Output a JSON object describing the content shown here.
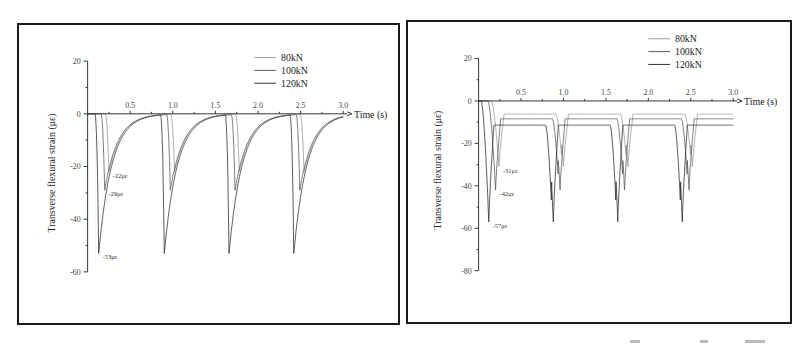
{
  "chart_data": [
    {
      "type": "line",
      "title": "",
      "xlabel": "Time (s)",
      "ylabel": "Transverse flexural strain (με)",
      "xlim": [
        0,
        3.0
      ],
      "ylim": [
        -60,
        20
      ],
      "xticks": [
        "0.5",
        "1.0",
        "1.5",
        "2.0",
        "2.5",
        "3.0"
      ],
      "xtick_values": [
        0.5,
        1.0,
        1.5,
        2.0,
        2.5,
        3.0
      ],
      "yticks": [
        "20",
        "0",
        "-20",
        "-40",
        "-60"
      ],
      "ytick_values": [
        20,
        0,
        -20,
        -40,
        -60
      ],
      "legend": {
        "position": "top-right",
        "entries": [
          "80kN",
          "100kN",
          "120kN"
        ]
      },
      "period_s": 0.77,
      "pulse_shape": "sharp",
      "series": [
        {
          "name": "80kN",
          "color": "#9a9a9a",
          "peak": -22,
          "peak_times": [
            0.25,
            1.02,
            1.78,
            2.54
          ]
        },
        {
          "name": "100kN",
          "color": "#5a5a5a",
          "peak": -29,
          "peak_times": [
            0.2,
            0.97,
            1.73,
            2.49
          ]
        },
        {
          "name": "120kN",
          "color": "#2e2e2e",
          "peak": -53,
          "peak_times": [
            0.13,
            0.9,
            1.66,
            2.42
          ]
        }
      ],
      "annotations": [
        {
          "text": "-22με",
          "x": 0.25,
          "y": -22
        },
        {
          "text": "-29με",
          "x": 0.2,
          "y": -29
        },
        {
          "text": "-53με",
          "x": 0.13,
          "y": -53
        }
      ]
    },
    {
      "type": "line",
      "title": "",
      "xlabel": "Time (s)",
      "ylabel": "Transverse flexural strain (με)",
      "xlim": [
        0,
        3.0
      ],
      "ylim": [
        -80,
        20
      ],
      "xticks": [
        "0.5",
        "1.0",
        "1.5",
        "2.0",
        "2.5",
        "3.0"
      ],
      "xtick_values": [
        0.5,
        1.0,
        1.5,
        2.0,
        2.5,
        3.0
      ],
      "yticks": [
        "20",
        "0",
        "-20",
        "-40",
        "-60",
        "-80"
      ],
      "ytick_values": [
        20,
        0,
        -20,
        -40,
        -60,
        -80
      ],
      "legend": {
        "position": "top-right",
        "entries": [
          "80kN",
          "100kN",
          "120kN"
        ]
      },
      "period_s": 0.76,
      "pulse_shape": "wide-with-plateau",
      "series": [
        {
          "name": "80kN",
          "color": "#9a9a9a",
          "peak": -31,
          "peak_times": [
            0.24,
            1.0,
            1.76,
            2.52
          ]
        },
        {
          "name": "100kN",
          "color": "#5a5a5a",
          "peak": -42,
          "peak_times": [
            0.2,
            0.96,
            1.72,
            2.48
          ]
        },
        {
          "name": "120kN",
          "color": "#2e2e2e",
          "peak": -57,
          "peak_times": [
            0.12,
            0.88,
            1.64,
            2.4
          ]
        }
      ],
      "annotations": [
        {
          "text": "-31με",
          "x": 0.24,
          "y": -31
        },
        {
          "text": "-42με",
          "x": 0.2,
          "y": -42
        },
        {
          "text": "-57με",
          "x": 0.12,
          "y": -57
        }
      ]
    }
  ]
}
